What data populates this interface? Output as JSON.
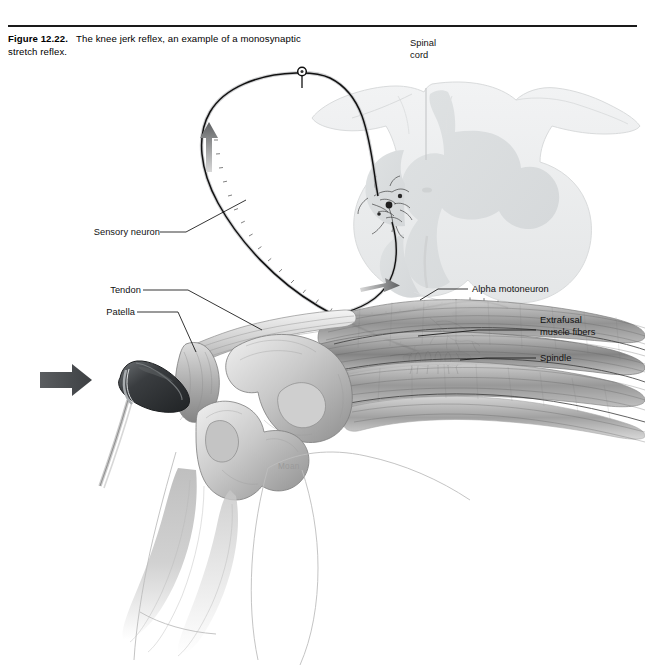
{
  "figure": {
    "number": "Figure 12.22.",
    "caption": "The knee jerk reflex, an example of a monosynaptic stretch reflex.",
    "caption_line1": "The knee jerk reflex, an example of a",
    "caption_line2": "monosynaptic stretch reflex."
  },
  "labels": {
    "spinal_cord_line1": "Spinal",
    "spinal_cord_line2": "cord",
    "sensory_neuron": "Sensory neuron",
    "tendon": "Tendon",
    "patella": "Patella",
    "alpha_motoneuron": "Alpha motoneuron",
    "extrafusal_line1": "Extrafusal",
    "extrafusal_line2": "muscle fibers",
    "spindle": "Spindle",
    "watermark": "Moan"
  },
  "illustration": {
    "title": "knee-jerk-reflex-arc",
    "description": "Sagittal view of the knee with patellar tendon struck by a reflex hammer; monosynaptic reflex arc drawn from muscle spindle through sensory neuron to spinal cord gray matter and back via alpha motoneuron to extrafusal muscle fibers.",
    "elements": [
      "reflex-hammer",
      "patella",
      "patellar-tendon",
      "femur-condyle",
      "tibia",
      "fibula",
      "quadriceps-muscle",
      "muscle-spindle",
      "spinal-cord-cross-section",
      "dorsal-root-ganglion",
      "sensory-axon",
      "motor-axon",
      "afferent-direction-arrow",
      "efferent-direction-arrow",
      "hammer-strike-arrow"
    ]
  },
  "colors": {
    "ink": "#111111",
    "rule": "#1a1a1a",
    "cord_outline": "#d2d4d6",
    "cord_white_matter": "#eceeef",
    "cord_gray_matter": "#dcdfe0",
    "bone_light": "#e8e8e8",
    "bone_mid": "#b8b8b8",
    "bone_dark": "#8a8a8a",
    "muscle_light": "#d8d8d8",
    "muscle_mid": "#9e9e9e",
    "muscle_dark": "#6e6e6e",
    "hammer_dark": "#2f3133",
    "hammer_mid": "#5a5d60",
    "arrow_gray": "#7a7c7e",
    "watermark": "#9a9a9a",
    "background": "#ffffff"
  }
}
